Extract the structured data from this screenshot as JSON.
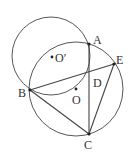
{
  "diagram": {
    "type": "geometry",
    "colors": {
      "stroke": "#444444",
      "point": "#222222",
      "label": "#333333",
      "background": "#ffffff"
    },
    "circles": [
      {
        "name": "circle-O",
        "center": "O",
        "cx": 76,
        "cy": 89,
        "r": 47
      },
      {
        "name": "circle-O-prime",
        "center": "O′",
        "cx": 51,
        "cy": 56,
        "r": 39
      }
    ],
    "points": {
      "A": {
        "label": "A",
        "x": 89,
        "y": 44,
        "lx": 93,
        "ly": 44
      },
      "B": {
        "label": "B",
        "x": 30,
        "y": 90,
        "lx": 18,
        "ly": 97
      },
      "C": {
        "label": "C",
        "x": 89,
        "y": 134,
        "lx": 84,
        "ly": 149
      },
      "D": {
        "label": "D",
        "x": 89,
        "y": 72,
        "lx": 93,
        "ly": 87
      },
      "E": {
        "label": "E",
        "x": 114,
        "y": 64,
        "lx": 116,
        "ly": 64
      },
      "O": {
        "label": "O",
        "x": 76,
        "y": 89,
        "lx": 72,
        "ly": 104
      },
      "Oprime": {
        "label": "O′",
        "x": 52,
        "y": 57,
        "lx": 55,
        "ly": 62
      }
    },
    "segments": [
      {
        "from": "B",
        "to": "E"
      },
      {
        "from": "B",
        "to": "C"
      },
      {
        "from": "A",
        "to": "C"
      },
      {
        "from": "C",
        "to": "E"
      }
    ]
  }
}
